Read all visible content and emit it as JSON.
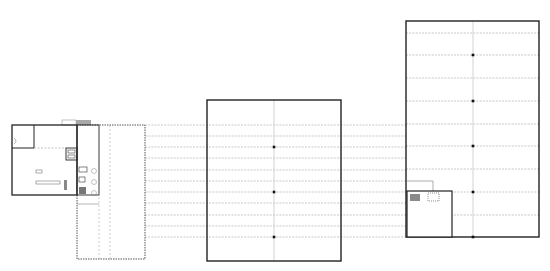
{
  "diagram": {
    "type": "architectural-floor-plan-comparison",
    "colors": {
      "background": "#ffffff",
      "wall": "#222222",
      "gridline": "#bdbdbd",
      "dashed_line": "#b0b0b0",
      "column": "#111111",
      "roof_accent": "#9a9a9a"
    },
    "plans": [
      {
        "id": "existing-building",
        "label": "",
        "x": 12,
        "y": 125,
        "w": 133,
        "h": 134
      },
      {
        "id": "middle-hall",
        "label": "",
        "x": 207,
        "y": 100,
        "w": 134,
        "h": 161,
        "center_x": 274,
        "columns_y": [
          147,
          192,
          237
        ]
      },
      {
        "id": "large-hall",
        "label": "",
        "x": 406,
        "y": 21,
        "w": 133,
        "h": 216,
        "center_x": 473,
        "columns_y": [
          55,
          101,
          146,
          192,
          237
        ],
        "annex": {
          "x": 407,
          "y": 191,
          "w": 45,
          "h": 46
        }
      }
    ],
    "connector_lines_y": [
      125,
      136,
      147,
      158,
      170,
      181,
      192,
      203,
      215,
      226,
      237
    ],
    "large_hall_inner_lines_y": [
      33,
      55,
      78,
      101,
      124,
      146,
      169,
      192,
      215
    ]
  }
}
